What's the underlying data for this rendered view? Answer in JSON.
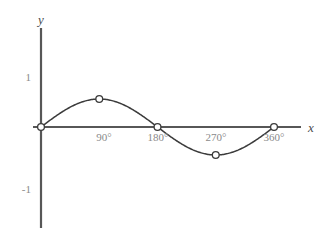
{
  "chart_data": {
    "type": "line",
    "title": "",
    "subtitle": "",
    "xlabel": "x",
    "ylabel": "y",
    "grid": false,
    "legend": "none",
    "xlim": [
      -30,
      400
    ],
    "ylim": [
      -1.6,
      1.6
    ],
    "x_tick_labels": [
      "90°",
      "180°",
      "270°",
      "360°"
    ],
    "x_tick_values": [
      90,
      180,
      270,
      360
    ],
    "y_tick_labels": [
      "1",
      "-1"
    ],
    "y_tick_values": [
      1,
      -1
    ],
    "series": [
      {
        "name": "sine",
        "x": [
          0,
          90,
          180,
          270,
          360
        ],
        "values": [
          0,
          1,
          0,
          -1,
          0
        ],
        "marker": "open-circle",
        "markers_shown": true
      }
    ],
    "annotations": []
  },
  "axis_labels": {
    "y": "y",
    "x": "x"
  },
  "y_ticks": {
    "positive_one": "1",
    "negative_one": "-1"
  },
  "x_ticks": {
    "deg90": "90°",
    "deg180": "180°",
    "deg270": "270°",
    "deg360": "360°"
  },
  "colors": {
    "background": "#ffffff",
    "axis": "#575757",
    "curve": "#3b3b3b",
    "tick_text": "#8a8a8a",
    "axis_label_text": "#4a4a4a",
    "marker_fill": "#ffffff"
  }
}
